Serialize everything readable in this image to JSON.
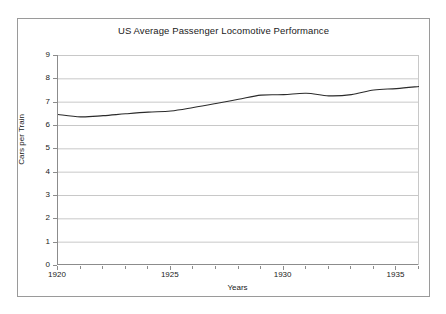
{
  "figure": {
    "background_color": "#ffffff",
    "frame_color": "#9a9a9a",
    "axis_color": "#8c8c8c",
    "gridline_color": "#c8c8c8",
    "line_color": "#2b2b2b",
    "text_color": "#1a1a1a"
  },
  "chart_data": {
    "type": "line",
    "title": "US Average Passenger Locomotive Performance",
    "xlabel": "Years",
    "ylabel": "Cars per Train",
    "xlim": [
      1920,
      1936
    ],
    "ylim": [
      0,
      9
    ],
    "grid": true,
    "legend": null,
    "xticks": [
      1920,
      1925,
      1930,
      1935
    ],
    "xtick_labels": [
      "1920",
      "1925",
      "1930",
      "1935"
    ],
    "xtick_minor_step": 1,
    "yticks": [
      0,
      1,
      2,
      3,
      4,
      5,
      6,
      7,
      8,
      9
    ],
    "ytick_labels": [
      "0",
      "1",
      "2",
      "3",
      "4",
      "5",
      "6",
      "7",
      "8",
      "9"
    ],
    "x": [
      1920,
      1921,
      1922,
      1923,
      1924,
      1925,
      1926,
      1927,
      1928,
      1929,
      1930,
      1931,
      1932,
      1933,
      1934,
      1935,
      1936
    ],
    "values": [
      6.45,
      6.35,
      6.4,
      6.48,
      6.55,
      6.6,
      6.75,
      6.92,
      7.1,
      7.28,
      7.3,
      7.36,
      7.25,
      7.3,
      7.5,
      7.56,
      7.65
    ],
    "series": [
      {
        "name": "Cars per Train",
        "values": [
          6.45,
          6.35,
          6.4,
          6.48,
          6.55,
          6.6,
          6.75,
          6.92,
          7.1,
          7.28,
          7.3,
          7.36,
          7.25,
          7.3,
          7.5,
          7.56,
          7.65
        ]
      }
    ]
  }
}
